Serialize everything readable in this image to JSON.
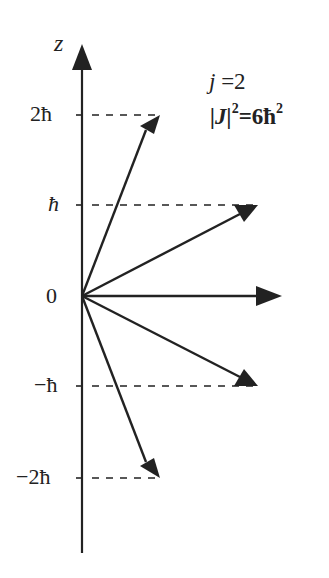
{
  "axis": {
    "label": "z"
  },
  "ticks": [
    {
      "label": "2ħ",
      "value": 2
    },
    {
      "label": "ħ",
      "value": 1
    },
    {
      "label": "0",
      "value": 0
    },
    {
      "label": "−ħ",
      "value": -1
    },
    {
      "label": "−2ħ",
      "value": -2
    }
  ],
  "annotation": {
    "j_line": "j =2",
    "j_symbol": "j",
    "j_value": " =2",
    "J_abs": "|J|",
    "J_exp": "2",
    "J_eq": "=6ħ",
    "J_eq_exp": "2"
  },
  "vectors": [
    {
      "m": 2,
      "label": "m=2"
    },
    {
      "m": 1,
      "label": "m=1"
    },
    {
      "m": 0,
      "label": "m=0"
    },
    {
      "m": -1,
      "label": "m=-1"
    },
    {
      "m": -2,
      "label": "m=-2"
    }
  ],
  "colors": {
    "ink": "#222222",
    "background": "#ffffff"
  }
}
